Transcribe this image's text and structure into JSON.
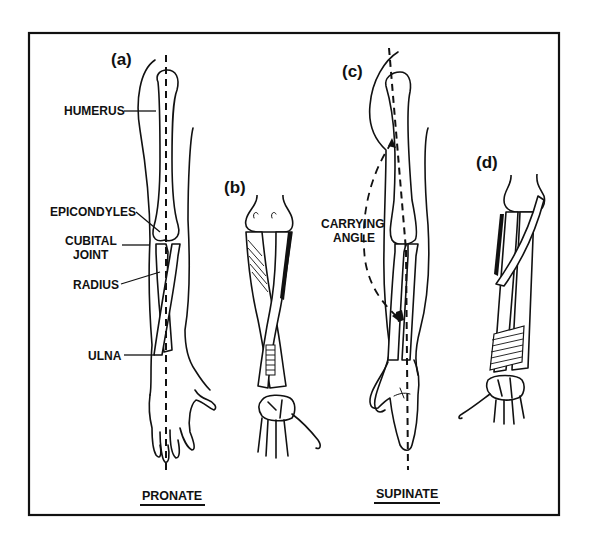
{
  "figure": {
    "panels": [
      {
        "id": "a",
        "label": "(a)",
        "view": "pronate"
      },
      {
        "id": "b",
        "label": "(b)",
        "view": "pronate"
      },
      {
        "id": "c",
        "label": "(c)",
        "view": "supinate"
      },
      {
        "id": "d",
        "label": "(d)",
        "view": "supinate"
      }
    ],
    "annotations": {
      "humerus": "HUMERUS",
      "epicondyles": "EPICONDYLES",
      "cubital_line1": "CUBITAL",
      "cubital_line2": "JOINT",
      "radius": "RADIUS",
      "ulna": "ULNA",
      "carrying_line1": "CARRYING",
      "carrying_line2": "ANGLE"
    },
    "captions": {
      "pronate": "PRONATE",
      "supinate": "SUPINATE"
    },
    "colors": {
      "ink": "#111111",
      "paper": "#ffffff"
    }
  }
}
